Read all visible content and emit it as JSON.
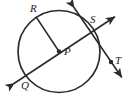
{
  "figure": {
    "type": "circle-geometry-diagram",
    "width": 132,
    "height": 100,
    "background_color": "#ffffff",
    "stroke_color": "#2b2b2b",
    "label_color": "#1d1d1d",
    "labels": {
      "center": "P",
      "point_on_circle_upper_left": "R",
      "point_on_circle_upper_right": "S",
      "point_outside_lower_right": "T",
      "point_lower_left": "Q"
    },
    "geometry": {
      "circle": {
        "center_x": 59,
        "center_y": 51.5,
        "radius": 41
      },
      "center_dot": {
        "cx": 59,
        "cy": 51.5,
        "r": 2.1
      },
      "t_dot": {
        "cx": 111,
        "cy": 62,
        "r": 2.1
      },
      "radius_segment_r_to_p": {
        "x1": 36.5,
        "y1": 17.5,
        "x2": 59,
        "y2": 51.5
      },
      "secant_line_q_s": {
        "x1": 12,
        "y1": 85,
        "x2": 116,
        "y2": 16
      },
      "crossing_line_through_s": {
        "x1": 73,
        "y1": 6,
        "x2": 123,
        "y2": 79
      }
    }
  }
}
